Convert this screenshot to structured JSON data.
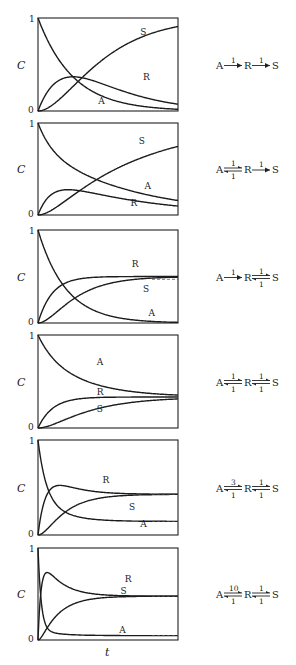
{
  "figure": {
    "ylabel": "C",
    "xlabel": "t",
    "y_tick_top": "1",
    "y_tick_bottom": "0"
  },
  "chart_data": [
    {
      "type": "line",
      "title": "",
      "xlabel": "",
      "ylabel": "C",
      "ylim": [
        0,
        1
      ],
      "grid": false,
      "scheme": {
        "A_R_forward": "1",
        "A_R_reverse": null,
        "R_S_forward": "1",
        "R_S_reverse": null
      },
      "k": {
        "k1": 1,
        "k_1": 0,
        "k2": 1,
        "k_2": 0
      },
      "series": [
        {
          "name": "A",
          "label_pos": [
            0.43,
            0.07
          ]
        },
        {
          "name": "R",
          "label_pos": [
            0.75,
            0.33
          ]
        },
        {
          "name": "S",
          "label_pos": [
            0.73,
            0.82
          ]
        }
      ],
      "equilibrium_dashes": []
    },
    {
      "type": "line",
      "title": "",
      "xlabel": "",
      "ylabel": "C",
      "ylim": [
        0,
        1
      ],
      "grid": false,
      "scheme": {
        "A_R_forward": "1",
        "A_R_reverse": "1",
        "R_S_forward": "1",
        "R_S_reverse": null
      },
      "k": {
        "k1": 1,
        "k_1": 1,
        "k2": 1,
        "k_2": 0
      },
      "series": [
        {
          "name": "A",
          "label_pos": [
            0.76,
            0.28
          ]
        },
        {
          "name": "R",
          "label_pos": [
            0.66,
            0.1
          ]
        },
        {
          "name": "S",
          "label_pos": [
            0.72,
            0.77
          ]
        }
      ],
      "equilibrium_dashes": []
    },
    {
      "type": "line",
      "title": "",
      "xlabel": "",
      "ylabel": "C",
      "ylim": [
        0,
        1
      ],
      "grid": false,
      "scheme": {
        "A_R_forward": "1",
        "A_R_reverse": null,
        "R_S_forward": "1",
        "R_S_reverse": "1"
      },
      "k": {
        "k1": 1,
        "k_1": 0,
        "k2": 1,
        "k_2": 1
      },
      "series": [
        {
          "name": "A",
          "label_pos": [
            0.79,
            0.08
          ]
        },
        {
          "name": "R",
          "label_pos": [
            0.67,
            0.6
          ]
        },
        {
          "name": "S",
          "label_pos": [
            0.75,
            0.33
          ]
        }
      ],
      "equilibrium_dashes": [
        0.47
      ]
    },
    {
      "type": "line",
      "title": "",
      "xlabel": "",
      "ylabel": "C",
      "ylim": [
        0,
        1
      ],
      "grid": false,
      "scheme": {
        "A_R_forward": "1",
        "A_R_reverse": "1",
        "R_S_forward": "1",
        "R_S_reverse": "1"
      },
      "k": {
        "k1": 1,
        "k_1": 1,
        "k2": 1,
        "k_2": 1
      },
      "series": [
        {
          "name": "A",
          "label_pos": [
            0.42,
            0.68
          ]
        },
        {
          "name": "R",
          "label_pos": [
            0.42,
            0.36
          ]
        },
        {
          "name": "S",
          "label_pos": [
            0.42,
            0.17
          ]
        }
      ],
      "equilibrium_dashes": [
        0.333
      ]
    },
    {
      "type": "line",
      "title": "",
      "xlabel": "",
      "ylabel": "C",
      "ylim": [
        0,
        1
      ],
      "grid": false,
      "scheme": {
        "A_R_forward": "3",
        "A_R_reverse": "1",
        "R_S_forward": "1",
        "R_S_reverse": "1"
      },
      "k": {
        "k1": 3,
        "k_1": 1,
        "k2": 1,
        "k_2": 1
      },
      "series": [
        {
          "name": "A",
          "label_pos": [
            0.73,
            0.08
          ]
        },
        {
          "name": "R",
          "label_pos": [
            0.46,
            0.55
          ]
        },
        {
          "name": "S",
          "label_pos": [
            0.65,
            0.26
          ]
        }
      ],
      "equilibrium_dashes": [
        0.43,
        0.143
      ]
    },
    {
      "type": "line",
      "title": "",
      "xlabel": "t",
      "ylabel": "C",
      "ylim": [
        0,
        1
      ],
      "grid": false,
      "scheme": {
        "A_R_forward": "10",
        "A_R_reverse": "1",
        "R_S_forward": "1",
        "R_S_reverse": "1"
      },
      "k": {
        "k1": 10,
        "k_1": 1,
        "k2": 1,
        "k_2": 1
      },
      "series": [
        {
          "name": "A",
          "label_pos": [
            0.58,
            0.08
          ]
        },
        {
          "name": "R",
          "label_pos": [
            0.62,
            0.63
          ]
        },
        {
          "name": "S",
          "label_pos": [
            0.59,
            0.5
          ]
        }
      ],
      "equilibrium_dashes": [
        0.476,
        0.048
      ]
    }
  ]
}
